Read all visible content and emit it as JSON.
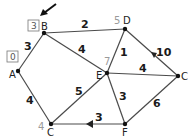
{
  "diagram": {
    "type": "weighted-graph-dijkstra",
    "nodes": [
      {
        "id": "A",
        "label": "A",
        "x": 18,
        "y": 71,
        "mark": "0",
        "mark_style": "boxed"
      },
      {
        "id": "B",
        "label": "B",
        "x": 44,
        "y": 33,
        "mark": "3",
        "mark_style": "boxed"
      },
      {
        "id": "D",
        "label": "D",
        "x": 125,
        "y": 29,
        "mark": "5",
        "mark_style": "grey"
      },
      {
        "id": "E",
        "label": "E",
        "x": 107,
        "y": 73,
        "mark": "7",
        "mark_style": "grey"
      },
      {
        "id": "C1",
        "label": "C",
        "x": 178,
        "y": 76,
        "mark": "",
        "mark_style": ""
      },
      {
        "id": "C2",
        "label": "C",
        "x": 51,
        "y": 124,
        "mark": "4",
        "mark_style": "grey"
      },
      {
        "id": "F",
        "label": "F",
        "x": 125,
        "y": 124,
        "mark": "",
        "mark_style": ""
      }
    ],
    "edges": [
      {
        "from": "A",
        "to": "B",
        "weight": "3"
      },
      {
        "from": "B",
        "to": "D",
        "weight": "2"
      },
      {
        "from": "B",
        "to": "E",
        "weight": "4"
      },
      {
        "from": "A",
        "to": "C2",
        "weight": "4"
      },
      {
        "from": "C2",
        "to": "E",
        "weight": "5"
      },
      {
        "from": "E",
        "to": "D",
        "weight": "1"
      },
      {
        "from": "D",
        "to": "C1",
        "weight": "10"
      },
      {
        "from": "E",
        "to": "C1",
        "weight": "4"
      },
      {
        "from": "E",
        "to": "F",
        "weight": "3"
      },
      {
        "from": "F",
        "to": "C2",
        "weight": "3"
      },
      {
        "from": "F",
        "to": "C1",
        "weight": "6"
      }
    ],
    "labels": {
      "mark_A": "0",
      "mark_B": "3",
      "mark_D": "5",
      "mark_E": "7",
      "mark_C": "4",
      "node_A": "A",
      "node_B": "B",
      "node_D": "D",
      "node_E": "E",
      "node_C_right": "C",
      "node_C_bottom": "C",
      "node_F": "F",
      "w_AB": "3",
      "w_BD": "2",
      "w_BE": "4",
      "w_AC": "4",
      "w_CE": "5",
      "w_ED": "1",
      "w_DC": "10",
      "w_EC": "4",
      "w_EF": "3",
      "w_FC": "3",
      "w_FC6": "6"
    },
    "pointer": "arrow pointing at B"
  }
}
